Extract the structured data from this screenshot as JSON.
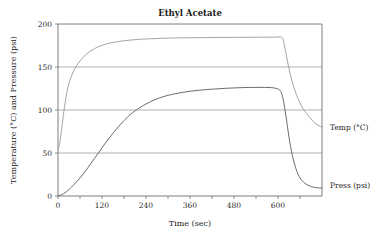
{
  "chart_data": {
    "type": "line",
    "title": "Ethyl Acetate",
    "xlabel": "Time (sec)",
    "ylabel": "Temperature (°C) and Pressure (psi)",
    "xlim": [
      0,
      720
    ],
    "ylim": [
      0,
      200
    ],
    "grid": true,
    "grid_axis": "y",
    "legend_position": "right-inline",
    "x_ticks": [
      0,
      60,
      120,
      180,
      240,
      300,
      360,
      420,
      480,
      540,
      600,
      660
    ],
    "x_tick_labels": [
      "0",
      "",
      "120",
      "",
      "240",
      "",
      "360",
      "",
      "480",
      "",
      "600",
      ""
    ],
    "y_ticks": [
      0,
      50,
      100,
      150,
      200
    ],
    "y_tick_labels": [
      "0",
      "50",
      "100",
      "150",
      "200"
    ],
    "series": [
      {
        "name": "Temp (°C)",
        "label": "Temp (°C)",
        "color": "#9a9a9a",
        "width": 0.9,
        "x": [
          0,
          5,
          10,
          15,
          20,
          25,
          30,
          40,
          50,
          60,
          75,
          90,
          110,
          130,
          150,
          180,
          210,
          240,
          280,
          320,
          360,
          420,
          480,
          540,
          590,
          610,
          615,
          620,
          628,
          638,
          650,
          665,
          680,
          700,
          720
        ],
        "y": [
          55,
          62,
          78,
          95,
          110,
          122,
          131,
          143,
          151,
          157,
          164,
          169,
          173.5,
          176.5,
          178.5,
          180.5,
          181.8,
          182.6,
          183.3,
          183.8,
          184,
          184.3,
          184.5,
          184.6,
          184.7,
          184.7,
          180,
          170,
          152,
          134,
          118,
          104,
          95,
          85,
          80
        ]
      },
      {
        "name": "Press (psi)",
        "label": "Press (psi)",
        "color": "#6b6b6b",
        "width": 1.0,
        "x": [
          0,
          10,
          20,
          30,
          45,
          60,
          75,
          90,
          110,
          130,
          150,
          170,
          190,
          210,
          240,
          270,
          300,
          340,
          380,
          420,
          460,
          500,
          540,
          570,
          590,
          605,
          612,
          618,
          624,
          632,
          642,
          655,
          670,
          690,
          710,
          720
        ],
        "y": [
          0,
          1.5,
          4,
          7.5,
          14,
          21,
          29,
          38,
          50,
          62,
          73,
          83,
          92,
          99,
          107,
          113,
          117,
          120.5,
          122.8,
          124.2,
          125.3,
          126,
          126.3,
          126.2,
          125.6,
          123,
          116,
          103,
          86,
          63,
          42,
          25,
          16,
          11,
          9.5,
          9.5
        ]
      }
    ]
  },
  "plot_geometry": {
    "left": 58,
    "right": 322,
    "top": 24,
    "bottom": 196,
    "title_x": 190,
    "title_y": 16,
    "xlabel_x": 190,
    "xlabel_y": 226,
    "ylabel_x": 16,
    "ylabel_y": 110
  },
  "series_labels": [
    {
      "text": "Temp (°C)",
      "x": 330,
      "y": 130
    },
    {
      "text": "Press (psi)",
      "x": 330,
      "y": 188
    }
  ]
}
